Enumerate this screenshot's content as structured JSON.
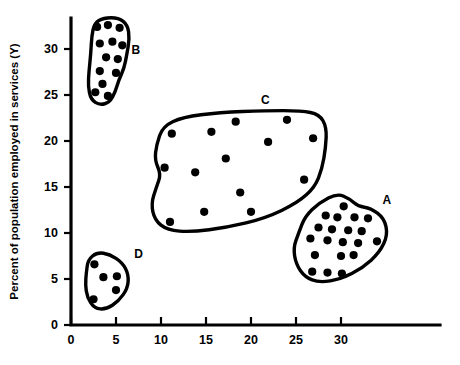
{
  "chart_data": {
    "type": "scatter",
    "title": "",
    "subtitle": "",
    "xlabel": "",
    "ylabel": "Percent of population employed in services (Y)",
    "xlim": [
      0,
      36.5
    ],
    "ylim": [
      0,
      33.5
    ],
    "xticks": [
      "0",
      "5",
      "10",
      "15",
      "20",
      "25",
      "30"
    ],
    "xtick_values": [
      0,
      5,
      10,
      15,
      20,
      25,
      30
    ],
    "yticks": [
      "0",
      "5",
      "10",
      "15",
      "20",
      "25",
      "30"
    ],
    "ytick_values": [
      0,
      5,
      10,
      15,
      20,
      25,
      30
    ],
    "grid": false,
    "legend": "none",
    "annotations": [
      "A",
      "B",
      "C",
      "D"
    ],
    "cluster_count": 4,
    "point_count_total": 52,
    "series": [
      {
        "name": "B",
        "label": "B",
        "label_x": 7.2,
        "label_y": 29.8,
        "point_count": 13,
        "points": [
          [
            2.9,
            32.4
          ],
          [
            4.1,
            32.6
          ],
          [
            5.4,
            32.3
          ],
          [
            3.2,
            30.6
          ],
          [
            4.6,
            30.8
          ],
          [
            5.7,
            30.4
          ],
          [
            3.9,
            29.1
          ],
          [
            5.2,
            28.9
          ],
          [
            3.2,
            27.6
          ],
          [
            5.0,
            27.4
          ],
          [
            3.5,
            26.2
          ],
          [
            2.7,
            25.3
          ],
          [
            4.1,
            24.9
          ]
        ],
        "hull": [
          [
            2.3,
            31.4
          ],
          [
            2.6,
            32.8
          ],
          [
            3.6,
            33.4
          ],
          [
            5.3,
            33.4
          ],
          [
            6.3,
            32.6
          ],
          [
            6.5,
            31.1
          ],
          [
            6.2,
            29.4
          ],
          [
            5.9,
            27.9
          ],
          [
            5.3,
            26.6
          ],
          [
            4.9,
            25.3
          ],
          [
            4.3,
            24.2
          ],
          [
            3.2,
            23.9
          ],
          [
            2.2,
            24.5
          ],
          [
            1.9,
            26.0
          ],
          [
            2.0,
            27.6
          ],
          [
            2.2,
            29.5
          ]
        ]
      },
      {
        "name": "C",
        "label": "C",
        "label_x": 21.6,
        "label_y": 24.4,
        "point_count": 14,
        "points": [
          [
            18.3,
            22.1
          ],
          [
            24.0,
            22.3
          ],
          [
            11.2,
            20.8
          ],
          [
            15.6,
            21.0
          ],
          [
            26.9,
            20.3
          ],
          [
            21.9,
            19.9
          ],
          [
            17.2,
            18.1
          ],
          [
            10.4,
            17.1
          ],
          [
            13.8,
            16.6
          ],
          [
            25.9,
            15.8
          ],
          [
            18.8,
            14.4
          ],
          [
            14.8,
            12.3
          ],
          [
            20.0,
            12.3
          ],
          [
            11.0,
            11.2
          ]
        ],
        "hull": [
          [
            9.5,
            19.6
          ],
          [
            10.2,
            21.6
          ],
          [
            12.4,
            22.6
          ],
          [
            16.5,
            23.1
          ],
          [
            21.6,
            23.3
          ],
          [
            25.6,
            23.3
          ],
          [
            27.6,
            22.9
          ],
          [
            28.4,
            21.5
          ],
          [
            28.3,
            19.3
          ],
          [
            27.9,
            17.0
          ],
          [
            27.1,
            15.0
          ],
          [
            25.2,
            13.3
          ],
          [
            21.6,
            11.6
          ],
          [
            17.3,
            10.6
          ],
          [
            13.4,
            10.1
          ],
          [
            10.7,
            10.3
          ],
          [
            9.3,
            11.4
          ],
          [
            8.9,
            13.2
          ],
          [
            9.5,
            15.0
          ],
          [
            10.0,
            16.4
          ],
          [
            9.3,
            17.9
          ]
        ]
      },
      {
        "name": "A",
        "label": "A",
        "label_x": 35.1,
        "label_y": 13.5,
        "point_count": 20,
        "points": [
          [
            30.3,
            12.9
          ],
          [
            28.3,
            11.9
          ],
          [
            29.6,
            11.7
          ],
          [
            31.5,
            11.7
          ],
          [
            33.0,
            11.6
          ],
          [
            27.5,
            10.6
          ],
          [
            29.0,
            10.4
          ],
          [
            30.8,
            10.3
          ],
          [
            32.3,
            10.2
          ],
          [
            26.6,
            9.4
          ],
          [
            28.5,
            9.2
          ],
          [
            30.2,
            9.0
          ],
          [
            31.9,
            8.9
          ],
          [
            34.0,
            9.1
          ],
          [
            27.1,
            7.6
          ],
          [
            30.0,
            7.5
          ],
          [
            31.4,
            7.6
          ],
          [
            26.8,
            5.8
          ],
          [
            28.5,
            5.7
          ],
          [
            30.1,
            5.6
          ]
        ],
        "hull": [
          [
            25.3,
            10.0
          ],
          [
            26.0,
            11.8
          ],
          [
            27.6,
            13.3
          ],
          [
            29.6,
            14.3
          ],
          [
            31.0,
            13.7
          ],
          [
            31.9,
            12.9
          ],
          [
            33.3,
            12.7
          ],
          [
            34.8,
            11.6
          ],
          [
            35.2,
            9.8
          ],
          [
            34.3,
            7.9
          ],
          [
            32.4,
            6.2
          ],
          [
            30.0,
            5.0
          ],
          [
            27.6,
            4.6
          ],
          [
            26.0,
            5.2
          ],
          [
            25.0,
            6.6
          ],
          [
            24.7,
            8.4
          ]
        ]
      },
      {
        "name": "D",
        "label": "D",
        "label_x": 7.5,
        "label_y": 7.6,
        "point_count": 5,
        "points": [
          [
            2.6,
            6.6
          ],
          [
            3.6,
            5.2
          ],
          [
            5.1,
            5.3
          ],
          [
            2.5,
            2.8
          ],
          [
            5.0,
            3.8
          ]
        ],
        "hull": [
          [
            1.7,
            5.7
          ],
          [
            1.9,
            7.1
          ],
          [
            2.9,
            7.9
          ],
          [
            4.3,
            7.7
          ],
          [
            5.7,
            6.8
          ],
          [
            6.4,
            5.5
          ],
          [
            6.3,
            4.0
          ],
          [
            5.3,
            2.6
          ],
          [
            3.9,
            1.7
          ],
          [
            2.6,
            1.8
          ],
          [
            1.8,
            3.0
          ],
          [
            1.6,
            4.4
          ]
        ]
      }
    ]
  },
  "axes": {
    "y_axis_title": "Percent of population employed in services (Y)",
    "x_axis_title": ""
  }
}
